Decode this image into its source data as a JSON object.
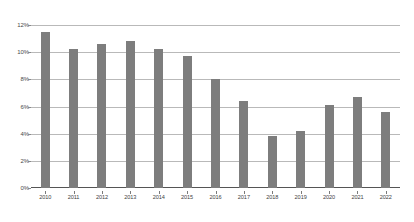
{
  "chart_data": {
    "type": "bar",
    "title": "",
    "subtitle": "",
    "xlabel": "",
    "ylabel": "",
    "categories": [
      "2010",
      "2011",
      "2012",
      "2013",
      "2014",
      "2015",
      "2016",
      "2017",
      "2018",
      "2019",
      "2020",
      "2021",
      "2022"
    ],
    "values": [
      11.5,
      10.2,
      10.6,
      10.8,
      10.2,
      9.7,
      8.0,
      6.4,
      3.8,
      4.2,
      6.1,
      6.7,
      5.6
    ],
    "value_suffix": "%",
    "ylim": [
      0,
      12
    ],
    "ytick_labels": [
      "12%",
      "10%",
      "8%",
      "6%",
      "4%",
      "2%",
      "0%"
    ],
    "ytick_values": [
      12,
      10,
      8,
      6,
      4,
      2,
      0
    ],
    "grid": true,
    "legend": false,
    "legend_position": "none",
    "bar_color": "#7d7d7d",
    "gridline_color": "#b9b9b9",
    "axis_color": "#555555",
    "background_color": "#ffffff"
  }
}
